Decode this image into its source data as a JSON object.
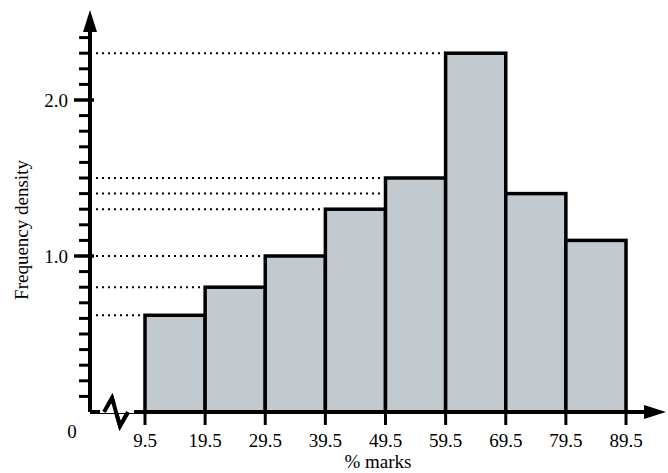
{
  "chart_data": {
    "type": "bar",
    "title": "",
    "subtitle": "",
    "xlabel": "% marks",
    "ylabel": "Frequency density",
    "categories": [
      "9.5-19.5",
      "19.5-29.5",
      "29.5-39.5",
      "39.5-49.5",
      "49.5-59.5",
      "59.5-69.5",
      "69.5-79.5",
      "79.5-89.5"
    ],
    "bin_edges": [
      9.5,
      19.5,
      29.5,
      39.5,
      49.5,
      59.5,
      69.5,
      79.5,
      89.5
    ],
    "values": [
      0.62,
      0.8,
      1.0,
      1.3,
      1.5,
      2.3,
      1.4,
      1.1
    ],
    "x_tick_labels": [
      "9.5",
      "19.5",
      "29.5",
      "39.5",
      "49.5",
      "59.5",
      "69.5",
      "79.5",
      "89.5"
    ],
    "y_tick_labels": [
      "0",
      "1.0",
      "2.0"
    ],
    "y_major_ticks": [
      1.0,
      2.0
    ],
    "y_minor_tick_step": 0.1,
    "ylim": [
      0,
      2.5
    ],
    "xlim": [
      9.5,
      89.5
    ],
    "grid": false,
    "guide_lines": [
      0.62,
      0.8,
      1.0,
      1.3,
      1.4,
      1.5,
      2.3
    ],
    "guide_line_style": "dotted",
    "legend": [],
    "legend_position": "none",
    "bar_fill_color": "#c2c9cf",
    "bar_edge_color": "#000000",
    "axis_color": "#000000",
    "axis_break_on_x": true,
    "zero_label": "0"
  },
  "axes": {
    "y_axis_title": "Frequency density",
    "x_axis_title": "% marks"
  }
}
